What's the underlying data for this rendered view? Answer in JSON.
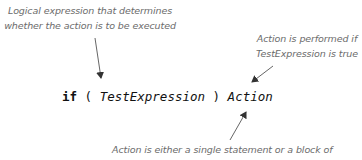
{
  "annotations": {
    "condition_note": {
      "line1": "Logical expression that determines",
      "line2": "whether the action is to be executed"
    },
    "action_note": {
      "line1": "Action is performed if",
      "line2": "TestExpression is true"
    },
    "action_definition_note": {
      "line1": "Action is either a single statement or a block of"
    }
  },
  "code": {
    "keyword": "if",
    "open_paren": "(",
    "test_expression": "TestExpression",
    "close_paren": ")",
    "action": "Action"
  },
  "colors": {
    "annotation_text": "#6b6b6b",
    "code_text": "#111111",
    "arrow": "#555555",
    "background": "#ffffff"
  }
}
